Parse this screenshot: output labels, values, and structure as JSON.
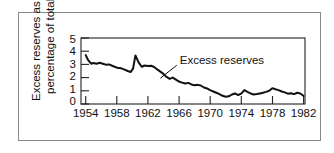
{
  "figure": {
    "background_color": "#ffffff",
    "frame_color": "#8a8a8a",
    "ink_color": "#111111"
  },
  "chart_data": {
    "type": "line",
    "title": "",
    "subtitle": "",
    "xlabel": "",
    "ylabel": "Excess reserves as a percentage of total",
    "ylabel_lines": [
      "Excess reserves as a",
      "percentage of total"
    ],
    "xlim": [
      1953.4,
      1982.2
    ],
    "ylim": [
      0,
      5
    ],
    "yticks": [
      0,
      1,
      2,
      3,
      4,
      5
    ],
    "ytick_labels": [
      "0",
      "1",
      "2",
      "3",
      "4",
      "5"
    ],
    "xticks": [
      1954,
      1958,
      1962,
      1966,
      1970,
      1974,
      1978,
      1982
    ],
    "xtick_labels": [
      "1954",
      "1958",
      "1962",
      "1966",
      "1970",
      "1974",
      "1978",
      "1982"
    ],
    "grid": false,
    "legend_position": "none",
    "line_color": "#111111",
    "line_width": 2.0,
    "annotations": [
      {
        "text": "Excess reserves",
        "x": 1966.1,
        "y": 3.05,
        "leader_to_x": 1963.6,
        "leader_to_y": 1.95
      }
    ],
    "series": [
      {
        "name": "Excess reserves",
        "x": [
          1954.0,
          1954.3,
          1954.7,
          1955.0,
          1955.4,
          1955.8,
          1956.2,
          1956.6,
          1957.0,
          1957.4,
          1957.8,
          1958.2,
          1958.6,
          1959.0,
          1959.4,
          1959.8,
          1960.1,
          1960.4,
          1960.8,
          1961.2,
          1961.6,
          1962.0,
          1962.4,
          1962.8,
          1963.2,
          1963.6,
          1964.0,
          1964.4,
          1964.8,
          1965.2,
          1965.6,
          1966.0,
          1966.4,
          1966.8,
          1967.2,
          1967.6,
          1968.0,
          1968.4,
          1968.8,
          1969.2,
          1969.6,
          1970.0,
          1970.4,
          1970.8,
          1971.2,
          1971.6,
          1972.0,
          1972.4,
          1972.8,
          1973.2,
          1973.6,
          1974.0,
          1974.4,
          1974.8,
          1975.2,
          1975.6,
          1976.0,
          1976.4,
          1976.8,
          1977.2,
          1977.6,
          1978.0,
          1978.4,
          1978.8,
          1979.2,
          1979.6,
          1980.0,
          1980.4,
          1980.8,
          1981.2,
          1981.6,
          1982.0
        ],
        "values": [
          3.7,
          3.35,
          3.05,
          3.1,
          3.05,
          3.12,
          3.05,
          2.98,
          3.0,
          2.9,
          2.8,
          2.72,
          2.7,
          2.6,
          2.5,
          2.42,
          2.7,
          3.68,
          3.15,
          2.82,
          2.92,
          2.88,
          2.9,
          2.8,
          2.62,
          2.45,
          2.28,
          2.05,
          1.9,
          2.0,
          1.85,
          1.7,
          1.62,
          1.55,
          1.6,
          1.48,
          1.42,
          1.45,
          1.4,
          1.25,
          1.18,
          1.05,
          0.95,
          0.85,
          0.75,
          0.62,
          0.55,
          0.58,
          0.72,
          0.8,
          0.68,
          0.78,
          1.05,
          0.92,
          0.8,
          0.72,
          0.75,
          0.8,
          0.85,
          0.92,
          1.0,
          1.2,
          1.12,
          1.05,
          0.95,
          0.88,
          0.78,
          0.82,
          0.75,
          0.85,
          0.8,
          0.62
        ]
      }
    ]
  }
}
